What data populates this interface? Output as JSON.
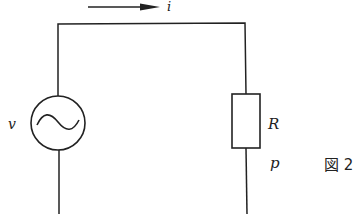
{
  "diagram": {
    "type": "circuit",
    "current_label": "i",
    "source_label": "v",
    "resistor_label": "R",
    "power_label": "p",
    "figure_caption": "図 2",
    "colors": {
      "line": "#222222",
      "background": "#ffffff"
    },
    "components": [
      {
        "kind": "ac-voltage-source",
        "label": "v"
      },
      {
        "kind": "resistor",
        "label": "R"
      },
      {
        "kind": "current-arrow",
        "label": "i",
        "direction": "right"
      }
    ]
  }
}
